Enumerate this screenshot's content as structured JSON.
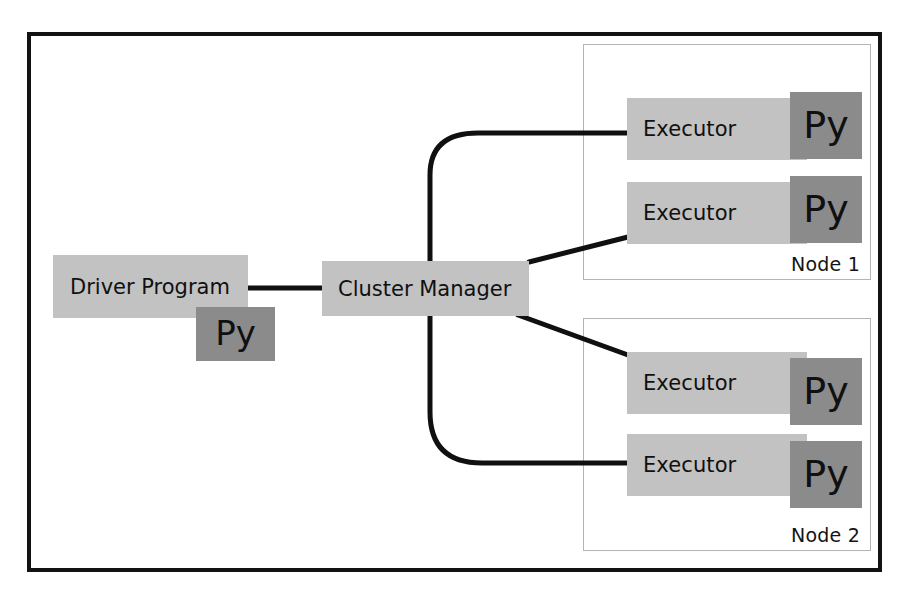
{
  "diagram": {
    "driver": {
      "label": "Driver Program",
      "py_label": "Py"
    },
    "cluster_manager": {
      "label": "Cluster Manager"
    },
    "nodes": [
      {
        "label": "Node 1",
        "executors": [
          {
            "label": "Executor",
            "py_label": "Py"
          },
          {
            "label": "Executor",
            "py_label": "Py"
          }
        ]
      },
      {
        "label": "Node 2",
        "executors": [
          {
            "label": "Executor",
            "py_label": "Py"
          },
          {
            "label": "Executor",
            "py_label": "Py"
          }
        ]
      }
    ],
    "colors": {
      "frame": "#121212",
      "node_border": "#b4b4b4",
      "box_fill": "#c2c2c2",
      "py_fill": "#8b8b8b",
      "connector": "#101010",
      "text": "#101010"
    }
  }
}
